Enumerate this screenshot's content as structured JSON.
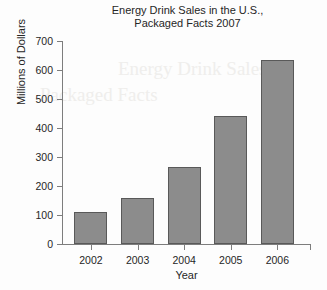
{
  "chart_data": {
    "type": "bar",
    "title": "Energy Drink Sales in the U.S., Packaged Facts 2007",
    "title_line1": "Energy Drink Sales in the U.S.,",
    "title_line2": "Packaged Facts 2007",
    "categories": [
      "2002",
      "2003",
      "2004",
      "2005",
      "2006"
    ],
    "values": [
      110,
      160,
      265,
      440,
      635
    ],
    "xlabel": "Year",
    "ylabel": "Millions of Dollars",
    "ylim": [
      0,
      700
    ],
    "ytick_labels": [
      "0",
      "100",
      "200",
      "300",
      "400",
      "500",
      "600",
      "700"
    ],
    "ytick_values": [
      0,
      100,
      200,
      300,
      400,
      500,
      600,
      700
    ],
    "grid": false,
    "legend": false,
    "bar_color": "#8c8c8c",
    "bar_edge_color": "#595959",
    "axis_color": "#7d7d7d",
    "background_color": "#fdfdfd"
  },
  "artifacts": {
    "bleed_text_1": "Energy Drink Sales",
    "bleed_text_2": "Packaged Facts"
  }
}
